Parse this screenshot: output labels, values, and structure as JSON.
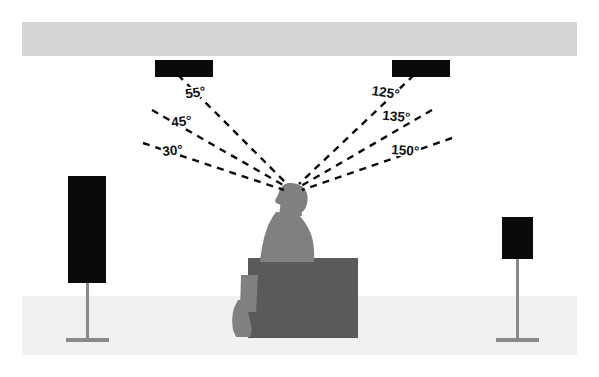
{
  "diagram": {
    "canvas": {
      "width": 599,
      "height": 377,
      "background": "#ffffff"
    },
    "room": {
      "ceiling": {
        "name": "ceiling-band",
        "x": 22,
        "y": 22,
        "width": 555,
        "height": 34,
        "color": "#d4d4d4"
      },
      "floor": {
        "name": "floor-band",
        "x": 22,
        "y": 296,
        "width": 555,
        "height": 59,
        "color": "#f1f1f1"
      },
      "wall": {
        "name": "wall-area",
        "color": "#ffffff"
      }
    },
    "listener": {
      "label": "seated-listener",
      "head_point": {
        "x": 293,
        "y": 185
      },
      "body_color": "#808080",
      "couch": {
        "x": 248,
        "y": 258,
        "width": 110,
        "height": 80,
        "color": "#5a5a5a"
      }
    },
    "ceiling_speakers": [
      {
        "name": "ceiling-speaker-left",
        "x": 155,
        "y": 60,
        "width": 58,
        "height": 17,
        "color": "#0a0a0a"
      },
      {
        "name": "ceiling-speaker-right",
        "x": 392,
        "y": 60,
        "width": 58,
        "height": 17,
        "color": "#0a0a0a"
      }
    ],
    "floor_speakers": [
      {
        "name": "floor-speaker-left",
        "cabinet": {
          "x": 68,
          "y": 176,
          "width": 38,
          "height": 107,
          "color": "#0a0a0a"
        },
        "pole": {
          "x": 86,
          "y": 283,
          "width": 3,
          "height": 57,
          "color": "#8a8a8a"
        },
        "base": {
          "x": 66,
          "y": 338,
          "width": 43,
          "height": 4,
          "color": "#8a8a8a"
        }
      },
      {
        "name": "floor-speaker-right",
        "cabinet": {
          "x": 502,
          "y": 217,
          "width": 31,
          "height": 42,
          "color": "#0a0a0a"
        },
        "pole": {
          "x": 516,
          "y": 259,
          "width": 3,
          "height": 81,
          "color": "#8a8a8a"
        },
        "base": {
          "x": 496,
          "y": 338,
          "width": 43,
          "height": 4,
          "color": "#8a8a8a"
        }
      }
    ],
    "angle_rays": [
      {
        "name": "ray-55",
        "label": "55°",
        "from": {
          "x": 178,
          "y": 75
        },
        "to": {
          "x": 287,
          "y": 184
        },
        "label_pos": {
          "x": 196,
          "y": 97
        },
        "label_rotation": -8
      },
      {
        "name": "ray-45",
        "label": "45°",
        "from": {
          "x": 152,
          "y": 110
        },
        "to": {
          "x": 285,
          "y": 186
        },
        "label_pos": {
          "x": 182,
          "y": 126
        },
        "label_rotation": -6
      },
      {
        "name": "ray-30",
        "label": "30°",
        "from": {
          "x": 143,
          "y": 143
        },
        "to": {
          "x": 284,
          "y": 190
        },
        "label_pos": {
          "x": 173,
          "y": 155
        },
        "label_rotation": -5
      },
      {
        "name": "ray-125",
        "label": "125°",
        "from": {
          "x": 414,
          "y": 75
        },
        "to": {
          "x": 299,
          "y": 184
        },
        "label_pos": {
          "x": 385,
          "y": 97
        },
        "label_rotation": 8
      },
      {
        "name": "ray-135",
        "label": "135°",
        "from": {
          "x": 432,
          "y": 110
        },
        "to": {
          "x": 301,
          "y": 186
        },
        "label_pos": {
          "x": 396,
          "y": 121
        },
        "label_rotation": 5
      },
      {
        "name": "ray-150",
        "label": "150°",
        "from": {
          "x": 452,
          "y": 138
        },
        "to": {
          "x": 302,
          "y": 190
        },
        "label_pos": {
          "x": 405,
          "y": 155
        },
        "label_rotation": 4
      }
    ],
    "style": {
      "dash_color": "#0a0a0a",
      "dash_width": 2.4,
      "dash_pattern": "7 6",
      "label_color": "#111111",
      "label_size": 13.5
    }
  }
}
